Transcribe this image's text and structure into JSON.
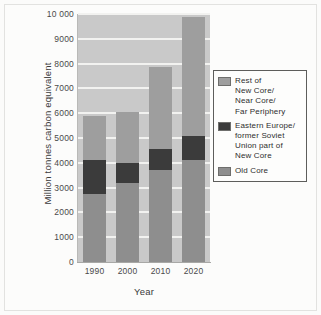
{
  "chart_data": {
    "type": "bar",
    "stacked": true,
    "title": "",
    "xlabel": "Year",
    "ylabel": "Million tonnes carbon equivalent",
    "categories": [
      "1990",
      "2000",
      "2010",
      "2020"
    ],
    "ylim": [
      0,
      10000
    ],
    "ytick_values": [
      0,
      1000,
      2000,
      3000,
      4000,
      5000,
      6000,
      7000,
      8000,
      9000,
      10000
    ],
    "ytick_labels": [
      "0",
      "1000",
      "2000",
      "3000",
      "4000",
      "5000",
      "6000",
      "7000",
      "8000",
      "9000",
      "10 000"
    ],
    "grid": true,
    "grid_axis": "y",
    "legend_position": "right",
    "plot_background": "#c9c9c9",
    "series": [
      {
        "name": "Old Core",
        "color": "#8e8e8e",
        "values": [
          2750,
          3200,
          3700,
          4100
        ]
      },
      {
        "name": "Eastern Europe/ former Soviet Union part of New Core",
        "color": "#3b3b3b",
        "values": [
          1350,
          800,
          850,
          1000
        ]
      },
      {
        "name": "Rest of New Core/ Near Core/ Far Periphery",
        "color": "#9e9e9e",
        "values": [
          1800,
          2050,
          3300,
          4800
        ]
      }
    ],
    "totals": [
      5900,
      6050,
      7850,
      9900
    ],
    "annotations": []
  },
  "legend": {
    "entries": [
      {
        "label": "Rest of\nNew Core/\nNear Core/\nFar Periphery",
        "color": "#9e9e9e"
      },
      {
        "label": "Eastern Europe/\nformer Soviet\nUnion part of\nNew Core",
        "color": "#3b3b3b"
      },
      {
        "label": "Old Core",
        "color": "#8e8e8e"
      }
    ]
  },
  "axes": {
    "y_title": "Million tonnes carbon equivalent",
    "x_title": "Year"
  }
}
